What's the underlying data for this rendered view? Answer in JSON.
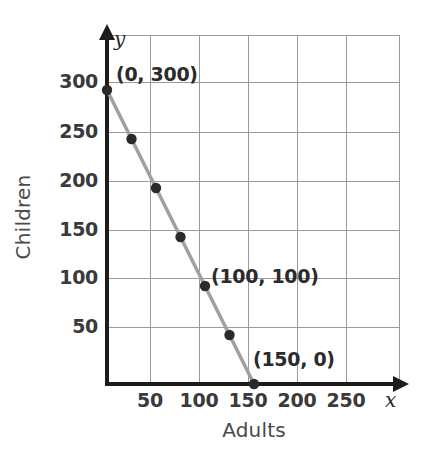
{
  "chart_data": {
    "type": "line",
    "title": "",
    "subtitle": "",
    "xlabel": "Adults",
    "ylabel": "Children",
    "x_axis_variable": "x",
    "y_axis_variable": "y",
    "xlim": [
      0,
      300
    ],
    "ylim": [
      0,
      360
    ],
    "x_ticks": [
      50,
      100,
      150,
      200,
      250
    ],
    "y_ticks": [
      50,
      100,
      150,
      200,
      250,
      300
    ],
    "x_tick_labels": [
      "50",
      "100",
      "150",
      "200",
      "250"
    ],
    "y_tick_labels": [
      "50",
      "100",
      "150",
      "200",
      "250",
      "300"
    ],
    "grid": true,
    "grid_spacing_x": 50,
    "grid_spacing_y": 50,
    "legend": false,
    "legend_position": "none",
    "series": [
      {
        "name": "Adults and Children",
        "x": [
          0,
          25,
          50,
          75,
          100,
          125,
          150
        ],
        "y": [
          300,
          250,
          200,
          150,
          100,
          50,
          0
        ],
        "points": [
          [
            0,
            300
          ],
          [
            25,
            250
          ],
          [
            50,
            200
          ],
          [
            75,
            150
          ],
          [
            100,
            100
          ],
          [
            125,
            50
          ],
          [
            150,
            0
          ]
        ],
        "line_color": "#a0a0a0",
        "marker_color": "#2b2b2b",
        "marker": "circle"
      }
    ],
    "annotations": [
      {
        "text": "(0, 300)",
        "x": 0,
        "y": 300,
        "left_px": 116,
        "top_px": 63
      },
      {
        "text": "(100, 100)",
        "x": 100,
        "y": 100,
        "left_px": 211,
        "top_px": 265
      },
      {
        "text": "(150, 0)",
        "x": 150,
        "y": 0,
        "left_px": 253,
        "top_px": 348
      }
    ]
  },
  "axes": {
    "x_label": "Adults",
    "y_label": "Children",
    "x_letter": "x",
    "y_letter": "y",
    "x_ticks": [
      "50",
      "100",
      "150",
      "200",
      "250"
    ],
    "y_ticks": [
      "300",
      "250",
      "200",
      "150",
      "100",
      "50"
    ]
  },
  "colors": {
    "axis": "#1c1c1c",
    "grid": "#9a9a9a",
    "line": "#a0a0a0",
    "marker": "#2b2b2b",
    "text": "#3a3a3a",
    "background": "#ffffff"
  }
}
